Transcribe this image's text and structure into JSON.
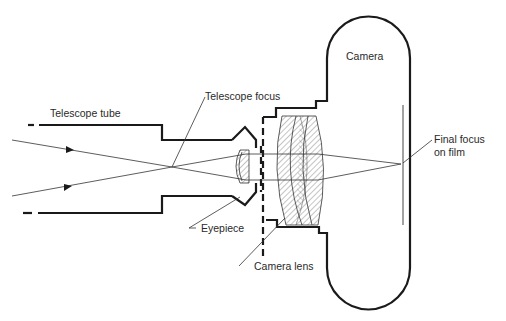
{
  "figure": {
    "labels": {
      "telescope_tube": "Telescope tube",
      "telescope_focus": "Telescope focus",
      "camera": "Camera",
      "eyepiece": "Eyepiece",
      "camera_lens": "Camera lens",
      "final_focus_line1": "Final focus",
      "final_focus_line2": "on film"
    },
    "colors": {
      "line": "#1a1a1a",
      "hatch": "#555555",
      "background": "#ffffff"
    }
  }
}
